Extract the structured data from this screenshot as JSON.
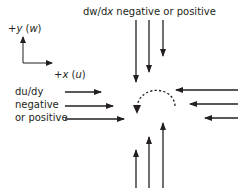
{
  "diagram": {
    "type": "flow-convergence-sketch",
    "colors": {
      "ink": "#231f20",
      "background": "#ffffff"
    },
    "axes": {
      "y_label_prefix": "+",
      "y_label_var": "y",
      "y_label_paren_open": " (",
      "y_label_comp": "w",
      "y_label_paren_close": ")",
      "x_label_prefix": "+",
      "x_label_var": "x",
      "x_label_paren_open": " (",
      "x_label_comp": "u",
      "x_label_paren_close": ")"
    },
    "top_label": {
      "num": "dw/d",
      "var": "x",
      "rest": " negative or positive"
    },
    "left_label": {
      "lines": [
        "du/dy",
        "negative",
        "or positive"
      ]
    },
    "arrow_groups": [
      {
        "name": "top-down-arrows",
        "direction": "down",
        "count": 3
      },
      {
        "name": "bottom-up-arrows",
        "direction": "up",
        "count": 3
      },
      {
        "name": "left-rightward-arrows",
        "direction": "right",
        "count": 3
      },
      {
        "name": "right-leftward-arrows",
        "direction": "left",
        "count": 3
      }
    ],
    "curved_arrow": {
      "style": "dashed",
      "direction": "counterclockwise-arc"
    }
  }
}
